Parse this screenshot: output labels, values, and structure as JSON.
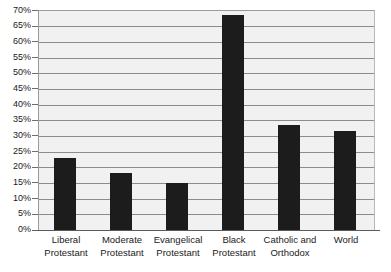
{
  "chart_data": {
    "type": "bar",
    "title": "",
    "subtitle": "",
    "xlabel": "",
    "ylabel": "",
    "categories": [
      "Liberal Protestant",
      "Moderate Protestant",
      "Evangelical Protestant",
      "Black Protestant",
      "Catholic and Orthodox",
      "World"
    ],
    "category_lines": [
      [
        "Liberal",
        "Protestant"
      ],
      [
        "Moderate",
        "Protestant"
      ],
      [
        "Evangelical",
        "Protestant"
      ],
      [
        "Black",
        "Protestant"
      ],
      [
        "Catholic and",
        "Orthodox"
      ],
      [
        "World"
      ]
    ],
    "values": [
      23,
      18,
      15,
      68.5,
      33.5,
      31.5
    ],
    "value_labels": [
      "23%",
      "18%",
      "15%",
      "68.5%",
      "33.5%",
      "31.5%"
    ],
    "ylim": [
      0,
      70
    ],
    "ytick_step": 5,
    "ytick_labels": [
      "70%",
      "65%",
      "60%",
      "55%",
      "50%",
      "45%",
      "40%",
      "35%",
      "30%",
      "25%",
      "20%",
      "15%",
      "10%",
      "5%",
      "0%"
    ],
    "ytick_values": [
      70,
      65,
      60,
      55,
      50,
      45,
      40,
      35,
      30,
      25,
      20,
      15,
      10,
      5,
      0
    ],
    "grid": true,
    "grid_axis": "y",
    "legend": false,
    "legend_position": "none",
    "series": [
      {
        "name": "",
        "values": [
          23,
          18,
          15,
          68.5,
          33.5,
          31.5
        ]
      }
    ],
    "colors": {
      "bar": "#1c1c1c",
      "plot_background": "#f1f1f1",
      "gridline": "#8c8c8c",
      "axis": "#5a5a5a",
      "text": "#1a1a1a",
      "page_background": "#ffffff"
    }
  }
}
